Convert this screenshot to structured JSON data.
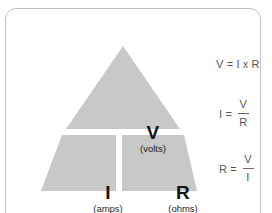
{
  "card": {
    "border_color": "#c3c3c3",
    "background_color": "#ffffff"
  },
  "diagram": {
    "name": "ohms-law-triangle",
    "fill_color": "#c8c8c8",
    "divider_color": "#ffffff",
    "cells": [
      {
        "position": "top",
        "symbol": "V",
        "unit": "(volts)"
      },
      {
        "position": "bottom-left",
        "symbol": "I",
        "unit": "(amps)"
      },
      {
        "position": "bottom-right",
        "symbol": "R",
        "unit": "(ohms)"
      }
    ]
  },
  "formulas": {
    "text_color": "#555555",
    "items": [
      {
        "id": "voltage",
        "lhs": "V",
        "equals": "=",
        "layout": "inline",
        "operand_left": "I",
        "operator": "x",
        "operand_right": "R"
      },
      {
        "id": "current",
        "lhs": "I",
        "equals": "=",
        "layout": "fraction",
        "numerator": "V",
        "denominator": "R"
      },
      {
        "id": "resistance",
        "lhs": "R",
        "equals": "=",
        "layout": "fraction",
        "numerator": "V",
        "denominator": "I"
      }
    ]
  }
}
